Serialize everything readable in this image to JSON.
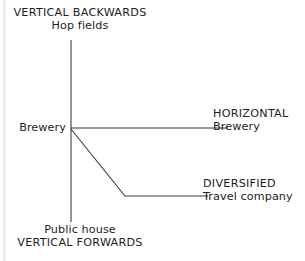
{
  "figure": {
    "background_color": "#ffffff",
    "line_color": "#3a3a3a",
    "text_color": "#1d1d1d"
  },
  "axes": {
    "vertical_backwards": {
      "direction_label": "VERTICAL BACKWARDS",
      "example_label": "Hop fields"
    },
    "vertical_forwards": {
      "direction_label": "VERTICAL FORWARDS",
      "example_label": "Public house"
    },
    "horizontal": {
      "direction_label": "HORIZONTAL",
      "example_label": "Brewery"
    },
    "diversified": {
      "direction_label": "DIVERSIFIED",
      "example_label": "Travel company"
    },
    "origin": {
      "label": "Brewery"
    }
  },
  "chart_data": {
    "type": "line",
    "title": "",
    "xlabel": "",
    "ylabel": "",
    "grid": false,
    "legend": "none",
    "annotations": [
      {
        "name": "vertical-backwards-caps",
        "text": "VERTICAL BACKWARDS",
        "x": 80,
        "y": 14
      },
      {
        "name": "vertical-backwards-example",
        "text": "Hop fields",
        "x": 80,
        "y": 27
      },
      {
        "name": "origin-label",
        "text": "Brewery",
        "x": 38,
        "y": 128
      },
      {
        "name": "horizontal-caps",
        "text": "HORIZONTAL",
        "x": 259,
        "y": 114
      },
      {
        "name": "horizontal-example",
        "text": "Brewery",
        "x": 259,
        "y": 127
      },
      {
        "name": "diversified-caps",
        "text": "DIVERSIFIED",
        "x": 254,
        "y": 184
      },
      {
        "name": "diversified-example",
        "text": "Travel company",
        "x": 254,
        "y": 197
      },
      {
        "name": "vertical-forwards-example",
        "text": "Public house",
        "x": 80,
        "y": 231
      },
      {
        "name": "vertical-forwards-caps",
        "text": "VERTICAL FORWARDS",
        "x": 80,
        "y": 244
      }
    ],
    "series": [
      {
        "name": "vertical-axis",
        "points": [
          [
            71,
            40
          ],
          [
            71,
            222
          ]
        ]
      },
      {
        "name": "horizontal-branch",
        "points": [
          [
            71,
            128
          ],
          [
            228,
            128
          ]
        ]
      },
      {
        "name": "diversified-branch",
        "points": [
          [
            71,
            129
          ],
          [
            125,
            196
          ],
          [
            208,
            196
          ]
        ]
      }
    ],
    "xlim": [
      0,
      305
    ],
    "ylim": [
      261,
      0
    ]
  }
}
